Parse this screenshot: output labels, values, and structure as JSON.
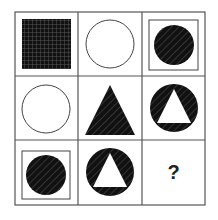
{
  "puzzle": {
    "type": "3x3 figure matrix",
    "missing_label": "?",
    "cells": [
      {
        "row": 1,
        "col": 1,
        "content": "grid-filled square"
      },
      {
        "row": 1,
        "col": 2,
        "content": "empty circle"
      },
      {
        "row": 1,
        "col": 3,
        "content": "hatched circle inside square frame"
      },
      {
        "row": 2,
        "col": 1,
        "content": "empty circle"
      },
      {
        "row": 2,
        "col": 2,
        "content": "hatched triangle"
      },
      {
        "row": 2,
        "col": 3,
        "content": "hatched circle with white triangle"
      },
      {
        "row": 3,
        "col": 1,
        "content": "hatched circle inside square frame"
      },
      {
        "row": 3,
        "col": 2,
        "content": "hatched circle with white triangle"
      },
      {
        "row": 3,
        "col": 3,
        "content": "?"
      }
    ]
  }
}
